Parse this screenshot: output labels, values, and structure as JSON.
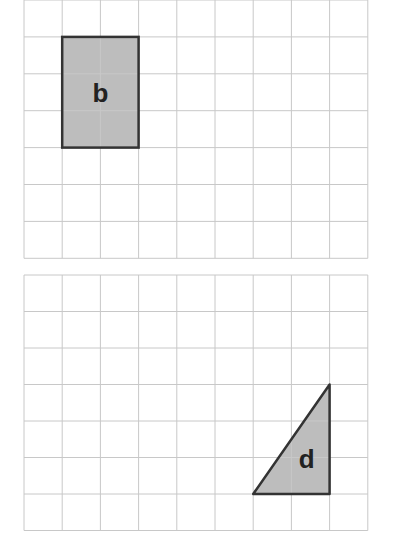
{
  "grids": [
    {
      "id": "grid-top",
      "x": 24,
      "y": 0,
      "cols": 9,
      "rows": 7,
      "cell_w": 38.2,
      "cell_h": 36.9,
      "shape": {
        "type": "rectangle",
        "label": "b",
        "col": 1,
        "row": 1,
        "w": 2,
        "h": 3
      }
    },
    {
      "id": "grid-bottom",
      "x": 24,
      "y": 275,
      "cols": 9,
      "rows": 7,
      "cell_w": 38.2,
      "cell_h": 36.5,
      "shape": {
        "type": "triangle",
        "label": "d",
        "points": [
          [
            6,
            6
          ],
          [
            8,
            6
          ],
          [
            8,
            3
          ]
        ]
      }
    }
  ],
  "colors": {
    "grid": "#c8c8c8",
    "fill": "#bdbdbd",
    "stroke": "#333333"
  }
}
